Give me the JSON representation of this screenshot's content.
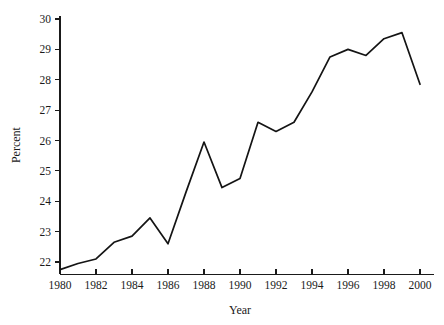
{
  "chart_data": {
    "type": "line",
    "title": "",
    "xlabel": "Year",
    "ylabel": "Percent",
    "x": [
      1980,
      1981,
      1982,
      1983,
      1984,
      1985,
      1986,
      1987,
      1988,
      1989,
      1990,
      1991,
      1992,
      1993,
      1994,
      1995,
      1996,
      1997,
      1998,
      1999,
      2000
    ],
    "values": [
      21.75,
      21.95,
      22.1,
      22.65,
      22.85,
      23.45,
      22.6,
      24.3,
      25.95,
      24.45,
      24.75,
      26.6,
      26.3,
      26.6,
      27.6,
      28.75,
      29.0,
      28.8,
      29.35,
      29.55,
      27.85
    ],
    "series": [
      {
        "name": "Percent",
        "values": [
          21.75,
          21.95,
          22.1,
          22.65,
          22.85,
          23.45,
          22.6,
          24.3,
          25.95,
          24.45,
          24.75,
          26.6,
          26.3,
          26.6,
          27.6,
          28.75,
          29.0,
          28.8,
          29.35,
          29.55,
          27.85
        ],
        "color": "#141414"
      }
    ],
    "xlim": [
      1980,
      2000
    ],
    "ylim": [
      21.6,
      30.1
    ],
    "yticks": [
      22,
      23,
      24,
      25,
      26,
      27,
      28,
      29,
      30
    ],
    "ytick_labels": [
      "22",
      "23",
      "24",
      "25",
      "26",
      "27",
      "28",
      "29",
      "30"
    ],
    "xticks": [
      1980,
      1982,
      1984,
      1986,
      1988,
      1990,
      1992,
      1994,
      1996,
      1998,
      2000
    ],
    "xtick_labels": [
      "1980",
      "1982",
      "1984",
      "1986",
      "1988",
      "1990",
      "1992",
      "1994",
      "1996",
      "1998",
      "2000"
    ],
    "xminor_ticks": [
      1981,
      1983,
      1985,
      1987,
      1989,
      1991,
      1993,
      1995,
      1997,
      1999
    ],
    "grid": false,
    "legend": false,
    "legend_position": "none",
    "line_color": "#141414",
    "axis_color": "#1a1a1a",
    "background_color": "#ffffff"
  }
}
